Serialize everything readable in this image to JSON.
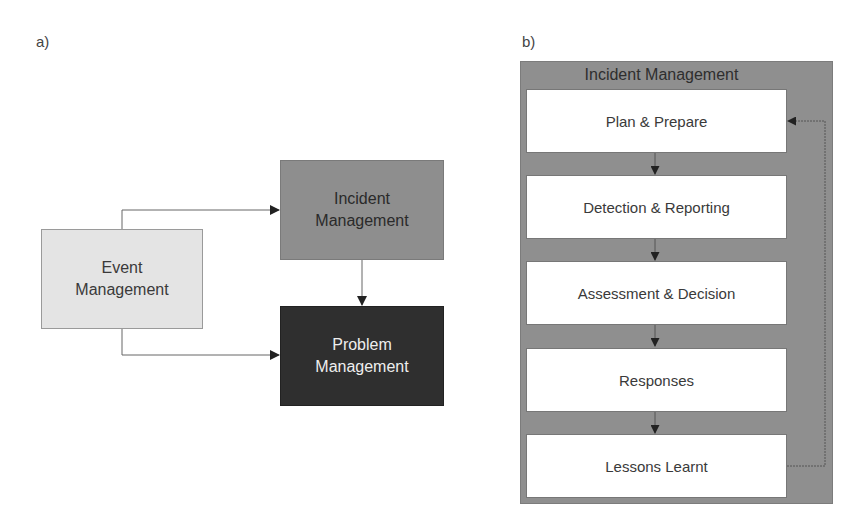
{
  "panel_a": {
    "label": "a)",
    "nodes": {
      "event": {
        "line1": "Event",
        "line2": "Management"
      },
      "incident": {
        "line1": "Incident",
        "line2": "Management"
      },
      "problem": {
        "line1": "Problem",
        "line2": "Management"
      }
    },
    "edges": [
      {
        "from": "Event Management",
        "to": "Incident Management"
      },
      {
        "from": "Event Management",
        "to": "Problem Management"
      },
      {
        "from": "Incident Management",
        "to": "Problem Management"
      }
    ],
    "colors": {
      "event": "#e4e4e4",
      "incident": "#8e8e8e",
      "problem": "#2f2f2f"
    }
  },
  "panel_b": {
    "label": "b)",
    "container_title": "Incident Management",
    "steps": [
      {
        "label": "Plan & Prepare"
      },
      {
        "label": "Detection & Reporting"
      },
      {
        "label": "Assessment & Decision"
      },
      {
        "label": "Responses"
      },
      {
        "label": "Lessons Learnt"
      }
    ],
    "feedback_edge": {
      "from": "Lessons Learnt",
      "to": "Plan & Prepare"
    },
    "colors": {
      "container": "#8f8f8f",
      "step": "#ffffff"
    }
  }
}
